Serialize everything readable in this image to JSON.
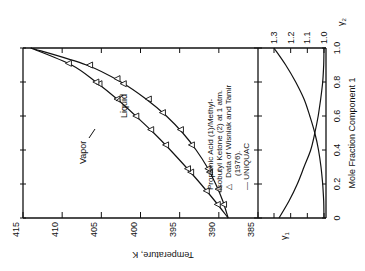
{
  "chart_data": [
    {
      "type": "line",
      "title": "Propionic Acid (1)/Methyl-isobutyl Ketone (2) at 1 atm.",
      "orientation": "figure rotated 90° (temperature axis along bottom edge, read rotated)",
      "xlabel": "Mole Fraction Component 1",
      "ylabel": "Temperature, K",
      "x_ticks": [
        "0",
        "0.2",
        "0.4",
        "0.6",
        "0.8",
        "1.0"
      ],
      "y_ticks": [
        "385",
        "390",
        "395",
        "400",
        "405",
        "410",
        "415"
      ],
      "xlim": [
        0,
        1.0
      ],
      "ylim": [
        385,
        415
      ],
      "grid": false,
      "legend": {
        "entries": [
          {
            "symbol": "triangle",
            "label": "Data of Wisniak and Tamir (1976)."
          },
          {
            "symbol": "line",
            "label": "UNIQUAC"
          }
        ],
        "position": "upper-right (rotated)"
      },
      "annotations": [
        "Liquid",
        "Vapor"
      ],
      "x": [
        0.0,
        0.1,
        0.2,
        0.3,
        0.4,
        0.5,
        0.6,
        0.7,
        0.8,
        0.9,
        1.0
      ],
      "series": [
        {
          "name": "Liquid",
          "values": [
            388.8,
            390.5,
            392.3,
            394.2,
            396.2,
            398.3,
            400.6,
            403.0,
            405.7,
            408.8,
            414.0
          ]
        },
        {
          "name": "Vapor",
          "values": [
            388.8,
            389.5,
            390.4,
            391.5,
            392.9,
            394.6,
            396.7,
            399.3,
            402.5,
            406.9,
            414.0
          ]
        }
      ],
      "data_points": {
        "liquid": [
          {
            "x": 0.08,
            "T": 390.2
          },
          {
            "x": 0.16,
            "T": 391.6
          },
          {
            "x": 0.27,
            "T": 393.6
          },
          {
            "x": 0.29,
            "T": 394.0
          },
          {
            "x": 0.43,
            "T": 396.8
          },
          {
            "x": 0.52,
            "T": 398.7
          },
          {
            "x": 0.6,
            "T": 400.6
          },
          {
            "x": 0.7,
            "T": 403.0
          },
          {
            "x": 0.79,
            "T": 405.3
          },
          {
            "x": 0.8,
            "T": 405.7
          },
          {
            "x": 0.91,
            "T": 409.2
          }
        ],
        "vapor": [
          {
            "x": 0.08,
            "T": 389.4
          },
          {
            "x": 0.17,
            "T": 390.1
          },
          {
            "x": 0.27,
            "T": 391.2
          },
          {
            "x": 0.29,
            "T": 391.4
          },
          {
            "x": 0.43,
            "T": 393.5
          },
          {
            "x": 0.52,
            "T": 394.9
          },
          {
            "x": 0.62,
            "T": 397.2
          },
          {
            "x": 0.7,
            "T": 399.0
          },
          {
            "x": 0.79,
            "T": 402.2
          },
          {
            "x": 0.82,
            "T": 403.0
          },
          {
            "x": 0.9,
            "T": 406.5
          }
        ]
      }
    },
    {
      "type": "line",
      "title": "Activity coefficients",
      "xlabel": "Mole Fraction Component 1",
      "ylabel": "γ",
      "gamma_ticks": [
        "1.0",
        "1.1",
        "1.2",
        "1.3"
      ],
      "ylim": [
        1.0,
        1.3
      ],
      "x": [
        0.0,
        0.1,
        0.2,
        0.3,
        0.4,
        0.5,
        0.6,
        0.7,
        0.8,
        0.9,
        1.0
      ],
      "series": [
        {
          "name": "γ1",
          "values": [
            1.27,
            1.21,
            1.16,
            1.12,
            1.08,
            1.055,
            1.035,
            1.02,
            1.008,
            1.002,
            1.0
          ]
        },
        {
          "name": "γ2",
          "values": [
            1.0,
            1.002,
            1.008,
            1.018,
            1.033,
            1.055,
            1.085,
            1.12,
            1.17,
            1.23,
            1.3
          ]
        }
      ]
    }
  ],
  "figure": {
    "system_title_lines": [
      "Propionic Acid (1)/Methyl-",
      "isobutyl Ketone (2) at 1 atm.",
      "Data of Wisniak and Tamir",
      "(1976)."
    ],
    "legend_marker": "△",
    "legend_line_label": "— UNIQUAC",
    "liquid_label": "Liquid",
    "vapor_label": "Vapor",
    "temperature_axis_label": "Temperature, K",
    "mole_fraction_axis_label": "Mole Fraction Component 1",
    "gamma1_label": "γ1",
    "gamma2_label": "γ2",
    "temperature_ticks": [
      "415",
      "410",
      "405",
      "400",
      "395",
      "390",
      "385"
    ],
    "mole_fraction_ticks": [
      "0",
      "0.2",
      "0.4",
      "0.6",
      "0.8",
      "1.0"
    ],
    "gamma_ticks": [
      "1.3",
      "1.2",
      "1.1",
      "1.0"
    ]
  }
}
